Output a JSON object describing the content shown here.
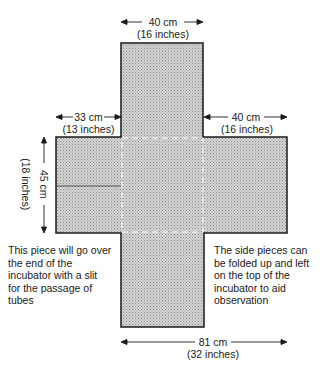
{
  "diagram": {
    "type": "cross-shaped cover pattern",
    "fill_color": "#c8c8c8",
    "outline_color": "#1a1a1a",
    "dimensions": {
      "top_width": {
        "cm": "40 cm",
        "inches": "(16 inches)"
      },
      "left_arm_width": {
        "cm": "33 cm",
        "inches": "(13 inches)"
      },
      "right_arm_width": {
        "cm": "40 cm",
        "inches": "(16 inches)"
      },
      "height": {
        "cm": "45 cm",
        "inches": "(18 inches)"
      },
      "total_width": {
        "cm": "81 cm",
        "inches": "(32 inches)"
      }
    },
    "notes": {
      "left": "This piece will go over\nthe end of the\nincubator with a slit\nfor the passage of\ntubes",
      "right": "The side pieces can\nbe folded up and left\non the top of the\nincubator to aid\nobservation"
    }
  }
}
